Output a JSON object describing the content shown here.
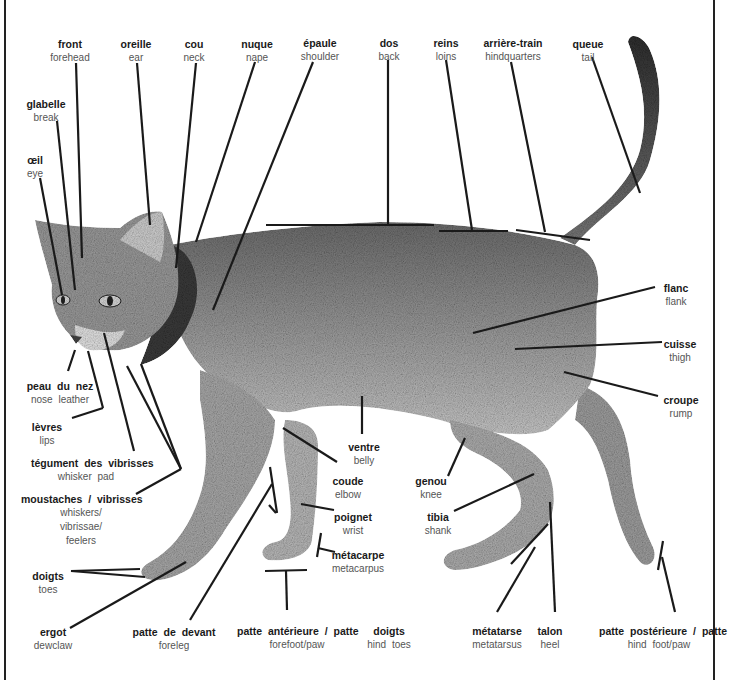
{
  "diagram": {
    "languages": [
      "French",
      "English"
    ],
    "labels": [
      {
        "id": "front",
        "fr": "front",
        "en": "forehead",
        "x": 70,
        "y": 37
      },
      {
        "id": "oreille",
        "fr": "oreille",
        "en": "ear",
        "x": 136,
        "y": 37
      },
      {
        "id": "cou",
        "fr": "cou",
        "en": "neck",
        "x": 194,
        "y": 37
      },
      {
        "id": "nuque",
        "fr": "nuque",
        "en": "nape",
        "x": 257,
        "y": 37
      },
      {
        "id": "epaule",
        "fr": "épaule",
        "en": "shoulder",
        "x": 320,
        "y": 36
      },
      {
        "id": "dos",
        "fr": "dos",
        "en": "back",
        "x": 389,
        "y": 36
      },
      {
        "id": "reins",
        "fr": "reins",
        "en": "loins",
        "x": 446,
        "y": 36
      },
      {
        "id": "arriere-train",
        "fr": "arrière-train",
        "en": "hindquarters",
        "x": 513,
        "y": 36
      },
      {
        "id": "queue",
        "fr": "queue",
        "en": "tail",
        "x": 588,
        "y": 37
      },
      {
        "id": "glabelle",
        "fr": "glabelle",
        "en": "break",
        "x": 46,
        "y": 97
      },
      {
        "id": "oeil",
        "fr": "œil",
        "en": "eye",
        "x": 35,
        "y": 153
      },
      {
        "id": "flanc",
        "fr": "flanc",
        "en": "flank",
        "x": 676,
        "y": 282
      },
      {
        "id": "cuisse",
        "fr": "cuisse",
        "en": "thigh",
        "x": 680,
        "y": 338
      },
      {
        "id": "croupe",
        "fr": "croupe",
        "en": "rump",
        "x": 681,
        "y": 394
      },
      {
        "id": "peau-du-nez",
        "fr": "peau du nez",
        "en": "nose leather",
        "x": 60,
        "y": 380
      },
      {
        "id": "levres",
        "fr": "lèvres",
        "en": "lips",
        "x": 47,
        "y": 421
      },
      {
        "id": "tegument-des-vibrisses",
        "fr": "tégument des vibrisses",
        "en": "whisker pad",
        "x": 86,
        "y": 457
      },
      {
        "id": "ventre",
        "fr": "ventre",
        "en": "belly",
        "x": 364,
        "y": 443
      },
      {
        "id": "coude",
        "fr": "coude",
        "en": "elbow",
        "x": 348,
        "y": 476
      },
      {
        "id": "genou",
        "fr": "genou",
        "en": "knee",
        "x": 431,
        "y": 476
      },
      {
        "id": "moustaches-vibrisses",
        "fr": "moustaches / vibrisses",
        "en": "whiskers/\nvibrissae/\nfeelers",
        "x": 81,
        "y": 494
      },
      {
        "id": "poignet",
        "fr": "poignet",
        "en": "wrist",
        "x": 353,
        "y": 513
      },
      {
        "id": "tibia",
        "fr": "tibia",
        "en": "shank",
        "x": 438,
        "y": 513
      },
      {
        "id": "metacarpe",
        "fr": "métacarpe",
        "en": "metacarpus",
        "x": 358,
        "y": 551
      },
      {
        "id": "doigts-avant",
        "fr": "doigts",
        "en": "toes",
        "x": 48,
        "y": 571
      },
      {
        "id": "ergot",
        "fr": "ergot",
        "en": "dewclaw",
        "x": 53,
        "y": 628
      },
      {
        "id": "patte-de-devant",
        "fr": "patte de devant",
        "en": "foreleg",
        "x": 174,
        "y": 628
      },
      {
        "id": "patte-anterieure",
        "fr": "patte antérieure / patte",
        "en": "forefoot/paw",
        "x": 297,
        "y": 627
      },
      {
        "id": "doigts-arriere",
        "fr": "doigts",
        "en": "hind toes",
        "x": 389,
        "y": 627
      },
      {
        "id": "metatarse",
        "fr": "métatarse",
        "en": "metatarsus",
        "x": 497,
        "y": 627
      },
      {
        "id": "talon",
        "fr": "talon",
        "en": "heel",
        "x": 550,
        "y": 627
      },
      {
        "id": "patte-posterieure",
        "fr": "patte postérieure / patte",
        "en": "hind foot/paw",
        "x": 659,
        "y": 627
      }
    ]
  }
}
